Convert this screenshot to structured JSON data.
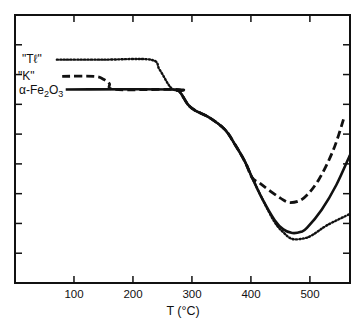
{
  "chart_data": {
    "type": "line",
    "title": "",
    "xlabel": "T (°C)",
    "ylabel": "",
    "xlim": [
      0,
      568
    ],
    "ylim": [
      0,
      9
    ],
    "x_ticks": [
      100,
      200,
      300,
      400,
      500
    ],
    "x_tick_labels": [
      "100",
      "200",
      "300",
      "400",
      "500"
    ],
    "y_ticks_count": 8,
    "y_tick_labels": [],
    "grid": false,
    "legend_position": "inline-left",
    "series": [
      {
        "name": "\"Tℓ\"",
        "style": "dotted",
        "label_text": "\"Tℓ\"",
        "points": [
          [
            71,
            7.5
          ],
          [
            150,
            7.5
          ],
          [
            230,
            7.5
          ],
          [
            245,
            7.17
          ],
          [
            260,
            6.67
          ],
          [
            268,
            6.5
          ],
          [
            280,
            6.4
          ],
          [
            293,
            6.0
          ],
          [
            305,
            5.8
          ],
          [
            330,
            5.55
          ],
          [
            356,
            5.15
          ],
          [
            373,
            4.65
          ],
          [
            390,
            4.07
          ],
          [
            402,
            3.54
          ],
          [
            420,
            2.8
          ],
          [
            440,
            2.05
          ],
          [
            455,
            1.7
          ],
          [
            470,
            1.48
          ],
          [
            490,
            1.5
          ],
          [
            505,
            1.62
          ],
          [
            530,
            1.95
          ],
          [
            568,
            2.32
          ]
        ]
      },
      {
        "name": "\"K\"",
        "style": "dashed",
        "label_text": "\"K\"",
        "points": [
          [
            80,
            6.94
          ],
          [
            135,
            6.94
          ],
          [
            150,
            6.84
          ],
          [
            160,
            6.7
          ],
          [
            170,
            6.5
          ],
          [
            270,
            6.5
          ],
          [
            280,
            6.4
          ],
          [
            293,
            6.0
          ],
          [
            305,
            5.8
          ],
          [
            330,
            5.55
          ],
          [
            356,
            5.15
          ],
          [
            373,
            4.65
          ],
          [
            390,
            4.07
          ],
          [
            402,
            3.54
          ],
          [
            415,
            3.35
          ],
          [
            430,
            3.13
          ],
          [
            450,
            2.85
          ],
          [
            467,
            2.7
          ],
          [
            490,
            2.86
          ],
          [
            515,
            3.47
          ],
          [
            540,
            4.48
          ],
          [
            558,
            5.56
          ]
        ]
      },
      {
        "name": "α-Fe2O3",
        "style": "solid",
        "label_text": "α-Fe",
        "label_sub1": "2",
        "label_mid": "O",
        "label_sub2": "3",
        "points": [
          [
            86,
            6.5
          ],
          [
            270,
            6.5
          ],
          [
            280,
            6.4
          ],
          [
            293,
            6.0
          ],
          [
            305,
            5.8
          ],
          [
            330,
            5.55
          ],
          [
            356,
            5.15
          ],
          [
            373,
            4.65
          ],
          [
            390,
            4.07
          ],
          [
            402,
            3.54
          ],
          [
            420,
            2.8
          ],
          [
            440,
            2.12
          ],
          [
            455,
            1.8
          ],
          [
            470,
            1.68
          ],
          [
            485,
            1.72
          ],
          [
            495,
            1.85
          ],
          [
            520,
            2.46
          ],
          [
            545,
            3.3
          ],
          [
            568,
            4.3
          ]
        ]
      }
    ]
  },
  "axis": {
    "xlabel": "T (°C)",
    "ticks": [
      "100",
      "200",
      "300",
      "400",
      "500"
    ]
  },
  "labels": {
    "tl": "\"Tℓ\"",
    "k": "\"K\"",
    "fe_a": "α-Fe",
    "fe_sub1": "2",
    "fe_o": "O",
    "fe_sub2": "3"
  }
}
